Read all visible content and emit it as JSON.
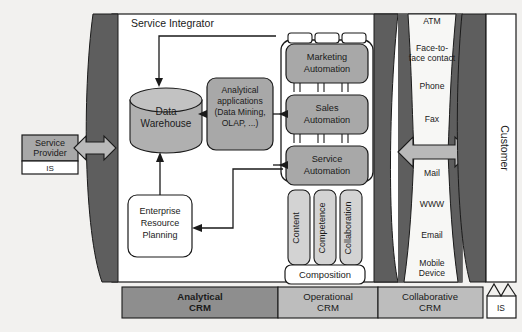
{
  "diagram": {
    "service_integrator_label": "Service Integrator",
    "customer_label": "Customer"
  },
  "colors": {
    "page_background": "#f2f1ef",
    "barrier_dark": "#5e5e5e",
    "box_gray": "#a8a8a8",
    "box_light_gray": "#d3d3d3",
    "cylinder_gray": "#b0b0b0",
    "arrow_gray": "#b9b9b9",
    "white": "#ffffff",
    "stroke": "#1a1a1a",
    "crm_dark": "#8e8e8e",
    "crm_light": "#bdbdbd"
  },
  "service_provider": {
    "name": "service-provider",
    "label_line1": "Service",
    "label_line2": "Provider",
    "is_label": "IS"
  },
  "customer": {
    "name": "customer",
    "label": "Customer",
    "is_label": "IS"
  },
  "analytical": {
    "data_warehouse": {
      "label_line1": "Data",
      "label_line2": "Warehouse"
    },
    "analytical_applications": {
      "label_line1": "Analytical",
      "label_line2": "applications",
      "label_line3": "(Data Mining,",
      "label_line4": "OLAP, ...)"
    },
    "erp": {
      "label_line1": "Enterprise",
      "label_line2": "Resource",
      "label_line3": "Planning"
    }
  },
  "operational": {
    "automation": [
      {
        "id": "marketing-automation",
        "line1": "Marketing",
        "line2": "Automation"
      },
      {
        "id": "sales-automation",
        "line1": "Sales",
        "line2": "Automation"
      },
      {
        "id": "service-automation",
        "line1": "Service",
        "line2": "Automation"
      }
    ],
    "pillars": [
      {
        "id": "content",
        "label": "Content"
      },
      {
        "id": "competence",
        "label": "Competence"
      },
      {
        "id": "collaboration",
        "label": "Collaboration"
      }
    ],
    "composition_label": "Composition"
  },
  "collaborative": {
    "channels": [
      {
        "id": "atm",
        "lines": [
          "ATM"
        ]
      },
      {
        "id": "face-to-face-contact",
        "lines": [
          "Face-to-",
          "face contact"
        ]
      },
      {
        "id": "phone",
        "lines": [
          "Phone"
        ]
      },
      {
        "id": "fax",
        "lines": [
          "Fax"
        ]
      },
      {
        "id": "mail",
        "lines": [
          "Mail"
        ]
      },
      {
        "id": "www",
        "lines": [
          "WWW"
        ]
      },
      {
        "id": "email",
        "lines": [
          "Email"
        ]
      },
      {
        "id": "mobile-device",
        "lines": [
          "Mobile",
          "Device"
        ]
      }
    ]
  },
  "crm_bar": [
    {
      "id": "analytical-crm",
      "line1": "Analytical",
      "line2": "CRM",
      "emphasis": "bold"
    },
    {
      "id": "operational-crm",
      "line1": "Operational",
      "line2": "CRM",
      "emphasis": "normal"
    },
    {
      "id": "collaborative-crm",
      "line1": "Collaborative",
      "line2": "CRM",
      "emphasis": "normal"
    }
  ]
}
